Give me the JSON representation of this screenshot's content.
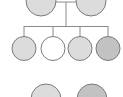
{
  "diagram": {
    "type": "pedigree",
    "colors": {
      "stroke": "#7a7a7a",
      "line": "#8a8a8a",
      "light": "#dcdcdc",
      "white": "#ffffff",
      "medium": "#c2c2c2"
    },
    "parents": [
      {
        "id": "parent-1",
        "fill": "light"
      },
      {
        "id": "parent-2",
        "fill": "light"
      }
    ],
    "children": [
      {
        "id": "child-1",
        "fill": "light"
      },
      {
        "id": "child-2",
        "fill": "white"
      },
      {
        "id": "child-3",
        "fill": "light"
      },
      {
        "id": "child-4",
        "fill": "medium"
      }
    ],
    "bottom": [
      {
        "id": "bottom-1",
        "fill": "light"
      },
      {
        "id": "bottom-2",
        "fill": "medium"
      }
    ]
  }
}
